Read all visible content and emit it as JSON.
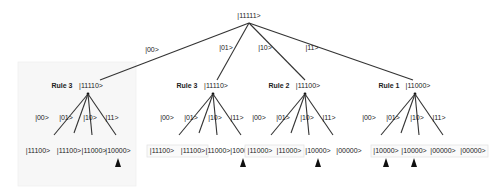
{
  "root": {
    "label": "|11111>",
    "x": 249,
    "y": 18
  },
  "level1_edges": [
    {
      "label": "|00>",
      "lx": 152,
      "ly": 52
    },
    {
      "label": "|01>",
      "lx": 226,
      "ly": 50
    },
    {
      "label": "|10>",
      "lx": 265,
      "ly": 50
    },
    {
      "label": "|11>",
      "lx": 312,
      "ly": 50
    }
  ],
  "subtrees": [
    {
      "rule": "Rule 3",
      "state": "|11110>",
      "cx": 88,
      "cy": 94,
      "edge_labels": [
        "|00>",
        "|01>",
        "|10>",
        "|11>"
      ],
      "leaves": [
        "|11100>",
        "|11100>",
        "|11000>",
        "|10000>"
      ],
      "leaf_x": [
        38,
        69,
        94,
        118
      ],
      "markers": [
        3
      ],
      "boxed": []
    },
    {
      "rule": "Rule 3",
      "state": "|11110>",
      "cx": 213,
      "cy": 94,
      "edge_labels": [
        "|00>",
        "|01>",
        "|10>",
        "|11>"
      ],
      "leaf_x": [
        162,
        193,
        218,
        243
      ],
      "leaves": [
        "|11100>",
        "|11100>",
        "|11000>",
        "|10000>"
      ],
      "markers": [
        3
      ],
      "boxed": [
        0,
        1
      ]
    },
    {
      "rule": "Rule 2",
      "state": "|11100>",
      "cx": 305,
      "cy": 94,
      "edge_labels": [
        "|00>",
        "|01>",
        "|10>",
        "|11>"
      ],
      "leaves": [
        "|11000>",
        "|11000>",
        "|10000>",
        "|00000>"
      ],
      "leaf_x": [
        260,
        289,
        318,
        349
      ],
      "markers": [
        2
      ],
      "boxed": [
        0,
        1
      ]
    },
    {
      "rule": "Rule 1",
      "state": "|11000>",
      "cx": 415,
      "cy": 94,
      "edge_labels": [
        "|00>",
        "|01>",
        "|10>",
        "|11>"
      ],
      "leaves": [
        "|10000>",
        "|10000>",
        "|00000>",
        "|00000>"
      ],
      "leaf_x": [
        386,
        414,
        443,
        473
      ],
      "markers": [
        0,
        1
      ],
      "boxed": [
        0,
        1,
        2,
        3
      ]
    }
  ],
  "colors": {
    "line": "#333333",
    "text": "#222222",
    "marker": "#111111",
    "shade": "#f7f7f7"
  }
}
